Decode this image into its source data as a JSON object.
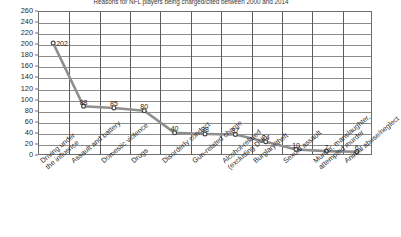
{
  "chart_data": {
    "type": "line",
    "title": "Reasons for NFL players being charged/cited between 2000 and 2014",
    "xlabel": "",
    "ylabel": "",
    "ylim": [
      0,
      260
    ],
    "ytick_step": 20,
    "grid": true,
    "legend": "none",
    "marker": "circle",
    "line_color": "#8f8f8f",
    "marker_color": "#4a4a4a",
    "grid_color": "#8c8c8c",
    "axis_color": "#6e6e6e",
    "categories": [
      "Driving under the influence",
      "Assault and battery",
      "Domestic violence",
      "Drugs",
      "Disorderly conduct",
      "Gun-related charge",
      "Alcohol-related (excluding DUI)",
      "Burglary/theft",
      "Sexual assault",
      "Murder, manslaughter, attempted murder",
      "Animal abuse/neglect"
    ],
    "category_lines": [
      [
        "Driving under",
        "the influence"
      ],
      [
        "Assault and battery"
      ],
      [
        "Domestic violence"
      ],
      [
        "Drugs"
      ],
      [
        "Disorderly conduct"
      ],
      [
        "Gun-related charge"
      ],
      [
        "Alcohol-related",
        "(excluding DUI)"
      ],
      [
        "Burglary/theft"
      ],
      [
        "Sexual assault"
      ],
      [
        "Murder, manslaughter,",
        "attempted murder"
      ],
      [
        "Animal abuse/neglect"
      ]
    ],
    "values": [
      202,
      88,
      85,
      80,
      40,
      38,
      37,
      24,
      10,
      7,
      6
    ],
    "yticks": [
      0,
      20,
      40,
      60,
      80,
      100,
      120,
      140,
      160,
      180,
      200,
      220,
      240,
      260
    ]
  }
}
